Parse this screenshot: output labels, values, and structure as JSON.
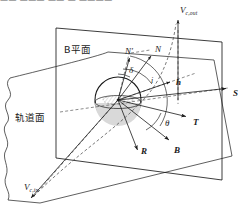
{
  "figure": {
    "domain": "diagram",
    "kind": "b-plane-flyby-geometry",
    "background_color": "#ffffff",
    "line_color": "#1a1a1a",
    "dash_color": "#4d4d4d",
    "planet_fill": "#d8d8d8",
    "cropped_top_text": "—— ———  ——   —   ————"
  },
  "labels": {
    "b_plane": {
      "text": "B平面",
      "meaning": "B-plane",
      "x": 64,
      "y": 45,
      "size": 9.5,
      "style": "cjk"
    },
    "orbital_plane": {
      "text": "轨道面",
      "meaning": "orbital plane",
      "x": 15,
      "y": 113,
      "size": 9.5,
      "style": "cjk"
    },
    "v_c_out": {
      "main": "V",
      "sub": "c,out",
      "meaning": "outgoing hyperbolic excess velocity",
      "x": 180,
      "y": 6,
      "size": 9
    },
    "v_c_in": {
      "main": "V",
      "sub": "c,in",
      "meaning": "incoming hyperbolic excess velocity",
      "x": 24,
      "y": 183,
      "size": 9
    },
    "n_prime": {
      "main": "N",
      "prime": "′",
      "meaning": "projected node vector",
      "x": 125,
      "y": 47,
      "size": 9
    },
    "n": {
      "main": "N",
      "meaning": "node vector",
      "x": 155,
      "y": 45,
      "size": 9
    },
    "h": {
      "main": "h",
      "meaning": "angular momentum vector",
      "x": 176,
      "y": 78,
      "size": 9
    },
    "s": {
      "main": "S",
      "meaning": "S axis, along incoming asymptote",
      "x": 233,
      "y": 89,
      "size": 9
    },
    "t": {
      "main": "T",
      "meaning": "T axis of B-plane",
      "x": 193,
      "y": 118,
      "size": 9
    },
    "r": {
      "main": "R",
      "meaning": "R axis of B-plane",
      "x": 141,
      "y": 147,
      "size": 9
    },
    "b": {
      "main": "B",
      "meaning": "impact parameter vector",
      "x": 174,
      "y": 146,
      "size": 9
    },
    "delta": {
      "main": "δ",
      "meaning": "declination angle",
      "x": 129,
      "y": 66,
      "size": 9
    },
    "theta": {
      "main": "θ",
      "meaning": "B-plane angle",
      "x": 165,
      "y": 119,
      "size": 9
    },
    "iota": {
      "main": "i",
      "meaning": "inclination angle",
      "x": 151,
      "y": 77,
      "size": 8
    }
  },
  "geometry": {
    "b_plane_quad": "56,28 222,42 222,180 56,158",
    "planet_circle": {
      "cx": 118,
      "cy": 100,
      "r": 23
    },
    "vectors": [
      {
        "name": "S",
        "from": "118,100",
        "to": "228,88"
      },
      {
        "name": "T",
        "from": "118,100",
        "to": "188,117"
      },
      {
        "name": "R",
        "from": "118,100",
        "to": "138,153"
      },
      {
        "name": "B",
        "from": "118,100",
        "to": "170,142"
      },
      {
        "name": "N",
        "from": "118,100",
        "to": "152,55"
      },
      {
        "name": "N-prime",
        "from": "118,100",
        "to": "130,57"
      },
      {
        "name": "h",
        "from": "118,100",
        "to": "172,81"
      },
      {
        "name": "V_c_out",
        "from": "178,100",
        "to": "178,18"
      },
      {
        "name": "V_c_in",
        "from": "120,103",
        "to": "32,198"
      }
    ]
  }
}
